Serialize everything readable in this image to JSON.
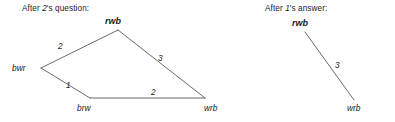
{
  "figure": {
    "background_color": "#ffffff",
    "edge_color": "#555a5e",
    "text_color": "#1a1a1a",
    "width": 395,
    "height": 122
  },
  "panels": [
    {
      "id": "left",
      "heading_prefix": "After ",
      "heading_agent": "2",
      "heading_suffix": "'s question:",
      "nodes": [
        {
          "id": "rwb",
          "label": "rwb",
          "x": 118,
          "y": 30,
          "label_x": 105,
          "label_y": 24,
          "emphasis": true
        },
        {
          "id": "bwr",
          "label": "bwr",
          "x": 41,
          "y": 68,
          "label_x": 12,
          "label_y": 71,
          "emphasis": false
        },
        {
          "id": "brw",
          "label": "brw",
          "x": 90,
          "y": 98,
          "label_x": 77,
          "label_y": 111,
          "emphasis": false
        },
        {
          "id": "wrb",
          "label": "wrb",
          "x": 205,
          "y": 98,
          "label_x": 204,
          "label_y": 111,
          "emphasis": false
        }
      ],
      "edges": [
        {
          "from": "bwr",
          "to": "rwb",
          "label": "2",
          "label_x": 58,
          "label_y": 49
        },
        {
          "from": "rwb",
          "to": "wrb",
          "label": "3",
          "label_x": 158,
          "label_y": 61
        },
        {
          "from": "bwr",
          "to": "brw",
          "label": "1",
          "label_x": 66,
          "label_y": 88
        },
        {
          "from": "brw",
          "to": "wrb",
          "label": "2",
          "label_x": 151,
          "label_y": 95
        }
      ]
    },
    {
      "id": "right",
      "heading_prefix": "After ",
      "heading_agent": "1",
      "heading_suffix": "'s answer:",
      "nodes": [
        {
          "id": "rwb",
          "label": "rwb",
          "x": 70,
          "y": 32,
          "label_x": 57,
          "label_y": 26,
          "emphasis": true
        },
        {
          "id": "wrb",
          "label": "wrb",
          "x": 119,
          "y": 100,
          "label_x": 112,
          "label_y": 111,
          "emphasis": false
        }
      ],
      "edges": [
        {
          "from": "rwb",
          "to": "wrb",
          "label": "3",
          "label_x": 100,
          "label_y": 68
        }
      ]
    }
  ]
}
